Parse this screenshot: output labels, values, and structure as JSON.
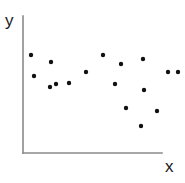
{
  "chart_data": {
    "type": "scatter",
    "title": "",
    "xlabel": "x",
    "ylabel": "y",
    "legend": null,
    "grid": false,
    "axis_style": "two-line L-shaped open axes, no ticks, no tick labels",
    "marker": {
      "shape": "circle",
      "color": "#111111",
      "size_px": 3.2
    },
    "axes_color": "#8a8a8a",
    "background_color": "#ffffff",
    "xlim": [
      0,
      100
    ],
    "ylim": [
      0,
      100
    ],
    "n_points": 17,
    "points": [
      {
        "px": 31,
        "py": 55,
        "x": 5.8,
        "y": 71.5
      },
      {
        "px": 51,
        "py": 62,
        "x": 20.1,
        "y": 66.4
      },
      {
        "px": 34,
        "py": 76,
        "x": 7.9,
        "y": 56.2
      },
      {
        "px": 56,
        "py": 84,
        "x": 23.7,
        "y": 50.4
      },
      {
        "px": 50,
        "py": 87,
        "x": 19.4,
        "y": 48.2
      },
      {
        "px": 69,
        "py": 83,
        "x": 33.1,
        "y": 51.1
      },
      {
        "px": 86,
        "py": 72,
        "x": 45.3,
        "y": 59.1
      },
      {
        "px": 103,
        "py": 55,
        "x": 57.6,
        "y": 71.5
      },
      {
        "px": 121,
        "py": 64,
        "x": 70.5,
        "y": 65.0
      },
      {
        "px": 143,
        "py": 59,
        "x": 86.3,
        "y": 68.6
      },
      {
        "px": 178,
        "py": 72,
        "x": 99.0,
        "y": 59.1
      },
      {
        "px": 115,
        "py": 84,
        "x": 66.2,
        "y": 50.4
      },
      {
        "px": 144,
        "py": 90,
        "x": 87.1,
        "y": 46.0
      },
      {
        "px": 126,
        "py": 108,
        "x": 74.1,
        "y": 33.0
      },
      {
        "px": 157,
        "py": 111,
        "x": 96.4,
        "y": 30.8
      },
      {
        "px": 141,
        "py": 126,
        "x": 84.9,
        "y": 19.9
      },
      {
        "px": 168,
        "py": 72,
        "x": 94.2,
        "y": 59.1
      }
    ],
    "axes_geometry": {
      "origin_px": {
        "x": 23,
        "y": 153
      },
      "y_axis_top_px": 16,
      "x_axis_right_px": 162,
      "line_width_px": 1.6
    }
  },
  "labels": {
    "y_axis": "y",
    "x_axis": "x"
  }
}
